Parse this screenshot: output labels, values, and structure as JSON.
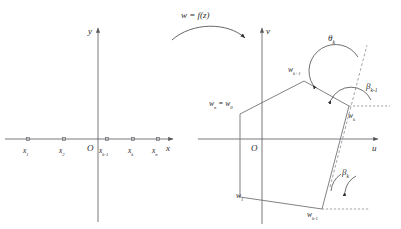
{
  "figure": {
    "mapping_label": "w = f(z)",
    "stroke_color": "#55565a",
    "text_color": "#2b2b2b"
  },
  "z_plane": {
    "axis_x_label": "x",
    "axis_y_label": "y",
    "origin_label": "O",
    "points": [
      {
        "id": "x1",
        "label": "x",
        "sub": "1",
        "cx": 28,
        "cy": 146
      },
      {
        "id": "x2",
        "label": "x",
        "sub": "2",
        "cx": 64,
        "cy": 146
      },
      {
        "id": "xk-1",
        "label": "x",
        "sub": "k-1",
        "cx": 107,
        "cy": 146
      },
      {
        "id": "xk",
        "label": "x",
        "sub": "k",
        "cx": 133,
        "cy": 146
      },
      {
        "id": "xn",
        "label": "x",
        "sub": "n",
        "cx": 158,
        "cy": 146
      }
    ]
  },
  "w_plane": {
    "axis_u_label": "u",
    "axis_v_label": "v",
    "origin_label": "O",
    "vertices": [
      {
        "id": "wn_w0",
        "label": "w",
        "sub": "n",
        "label2": " = w",
        "sub2": "0",
        "x": 239,
        "y": 104
      },
      {
        "id": "wk+1",
        "label": "w",
        "sub": "k+1",
        "x": 301,
        "y": 73
      },
      {
        "id": "wk",
        "label": "w",
        "sub": "k",
        "x": 353,
        "y": 113
      },
      {
        "id": "wk-1",
        "label": "w",
        "sub": "k-1",
        "x": 311,
        "y": 204
      },
      {
        "id": "w1",
        "label": "w",
        "sub": "1",
        "x": 243,
        "y": 192
      }
    ],
    "angles": [
      {
        "id": "theta_k",
        "label": "θ",
        "sub": "k",
        "x": 331,
        "y": 38
      },
      {
        "id": "beta_k-1",
        "label": "β",
        "sub": "k-1",
        "x": 369,
        "y": 86
      },
      {
        "id": "beta_k",
        "label": "β",
        "sub": "k",
        "x": 345,
        "y": 172
      }
    ]
  }
}
